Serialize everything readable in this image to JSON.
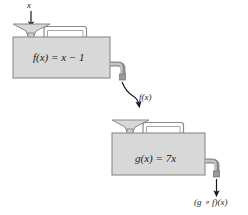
{
  "diagram": {
    "type": "function-machine-composition",
    "background_color": "#ffffff",
    "body_fill": "#d8d8d8",
    "body_stroke": "#8a8a8a",
    "arrow_color": "#1a1a1a",
    "labels": {
      "input": "x",
      "machine_1_rule": "f(x) = x − 1",
      "intermediate": "f(x)",
      "machine_2_rule": "g(x) = 7x",
      "output": "(g ∘ f)(x)"
    },
    "machines": [
      {
        "name": "machine-f",
        "rule": "f(x) = x − 1",
        "input_label": "x",
        "output_label": "f(x)"
      },
      {
        "name": "machine-g",
        "rule": "g(x) = 7x",
        "input_label": "f(x)",
        "output_label": "(g ∘ f)(x)"
      }
    ]
  }
}
